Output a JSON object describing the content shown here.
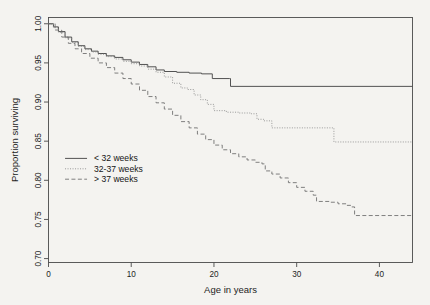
{
  "figure": {
    "kind": "kaplan-meier-survival-curve",
    "page_marker": "",
    "background_color": "#f4f3f0",
    "frame_color": "#4a4a4a"
  },
  "axes": {
    "x": {
      "label": "Age in years",
      "ticks": [
        0,
        10,
        20,
        30,
        40
      ],
      "tick_labels": [
        "0",
        "10",
        "20",
        "30",
        "40"
      ],
      "range": [
        0,
        44
      ]
    },
    "y": {
      "label": "Proportion surviving",
      "ticks": [
        0.7,
        0.75,
        0.8,
        0.85,
        0.9,
        0.95,
        1.0
      ],
      "tick_labels": [
        "0.70",
        "0.75",
        "0.80",
        "0.85",
        "0.90",
        "0.95",
        "1.00"
      ],
      "range": [
        0.695,
        1.008
      ]
    }
  },
  "legend": {
    "position": "left-middle",
    "items": [
      {
        "label": "< 32 weeks",
        "style": "solid",
        "color": "#4a4a4a"
      },
      {
        "label": "32-37 weeks",
        "style": "dotted",
        "color": "#8a8a8a"
      },
      {
        "label": "> 37 weeks",
        "style": "dashed",
        "color": "#6a6a6a"
      }
    ]
  },
  "chart_data": {
    "type": "line",
    "title": "",
    "subtitle": "",
    "xlabel": "Age in years",
    "ylabel": "Proportion surviving",
    "xlim": [
      0,
      44
    ],
    "ylim": [
      0.695,
      1.008
    ],
    "grid": false,
    "legend_position": "left-middle",
    "step_shape": "hv",
    "series": [
      {
        "name": "< 32 weeks",
        "style": "solid",
        "color": "#4a4a4a",
        "final_value": 0.92,
        "points": [
          [
            0,
            1.0
          ],
          [
            0.6,
            0.996
          ],
          [
            1.2,
            0.99
          ],
          [
            2.0,
            0.983
          ],
          [
            2.8,
            0.977
          ],
          [
            3.6,
            0.972
          ],
          [
            4.4,
            0.968
          ],
          [
            5.2,
            0.965
          ],
          [
            6.0,
            0.962
          ],
          [
            7.0,
            0.959
          ],
          [
            8.0,
            0.957
          ],
          [
            9.0,
            0.954
          ],
          [
            10.0,
            0.951
          ],
          [
            11.0,
            0.948
          ],
          [
            12.0,
            0.945
          ],
          [
            13.0,
            0.941
          ],
          [
            14.0,
            0.939
          ],
          [
            15.5,
            0.938
          ],
          [
            17.0,
            0.937
          ],
          [
            18.5,
            0.936
          ],
          [
            19.8,
            0.93
          ],
          [
            21.9,
            0.93
          ],
          [
            22.0,
            0.92
          ],
          [
            44.0,
            0.92
          ]
        ]
      },
      {
        "name": "32-37 weeks",
        "style": "dotted",
        "color": "#8a8a8a",
        "final_value": 0.849,
        "points": [
          [
            0,
            1.0
          ],
          [
            0.6,
            0.995
          ],
          [
            1.2,
            0.989
          ],
          [
            2.0,
            0.982
          ],
          [
            2.8,
            0.976
          ],
          [
            3.6,
            0.971
          ],
          [
            4.4,
            0.967
          ],
          [
            5.2,
            0.964
          ],
          [
            6.0,
            0.961
          ],
          [
            7.0,
            0.958
          ],
          [
            8.0,
            0.955
          ],
          [
            9.0,
            0.952
          ],
          [
            10.0,
            0.949
          ],
          [
            11.0,
            0.946
          ],
          [
            12.0,
            0.942
          ],
          [
            13.0,
            0.938
          ],
          [
            14.0,
            0.932
          ],
          [
            15.0,
            0.924
          ],
          [
            16.0,
            0.918
          ],
          [
            16.8,
            0.916
          ],
          [
            17.6,
            0.909
          ],
          [
            18.4,
            0.903
          ],
          [
            19.2,
            0.897
          ],
          [
            20.0,
            0.889
          ],
          [
            21.5,
            0.887
          ],
          [
            23.0,
            0.886
          ],
          [
            24.5,
            0.885
          ],
          [
            25.2,
            0.878
          ],
          [
            26.0,
            0.876
          ],
          [
            27.0,
            0.867
          ],
          [
            30.0,
            0.867
          ],
          [
            34.4,
            0.867
          ],
          [
            34.5,
            0.849
          ],
          [
            44.0,
            0.849
          ]
        ]
      },
      {
        "name": "> 37 weeks",
        "style": "dashed",
        "color": "#6a6a6a",
        "final_value": 0.755,
        "points": [
          [
            0,
            1.0
          ],
          [
            0.8,
            0.992
          ],
          [
            1.6,
            0.983
          ],
          [
            2.4,
            0.975
          ],
          [
            3.2,
            0.968
          ],
          [
            4.0,
            0.962
          ],
          [
            5.0,
            0.956
          ],
          [
            6.0,
            0.95
          ],
          [
            7.0,
            0.944
          ],
          [
            8.0,
            0.937
          ],
          [
            9.0,
            0.93
          ],
          [
            10.0,
            0.923
          ],
          [
            11.0,
            0.915
          ],
          [
            12.0,
            0.907
          ],
          [
            13.0,
            0.899
          ],
          [
            14.0,
            0.891
          ],
          [
            15.0,
            0.883
          ],
          [
            16.0,
            0.875
          ],
          [
            17.0,
            0.867
          ],
          [
            18.0,
            0.859
          ],
          [
            19.0,
            0.852
          ],
          [
            20.0,
            0.845
          ],
          [
            21.0,
            0.839
          ],
          [
            22.0,
            0.834
          ],
          [
            23.0,
            0.83
          ],
          [
            24.0,
            0.826
          ],
          [
            25.0,
            0.823
          ],
          [
            25.8,
            0.821
          ],
          [
            26.2,
            0.812
          ],
          [
            27.0,
            0.808
          ],
          [
            28.0,
            0.803
          ],
          [
            29.0,
            0.797
          ],
          [
            30.0,
            0.791
          ],
          [
            31.0,
            0.786
          ],
          [
            32.0,
            0.781
          ],
          [
            32.4,
            0.773
          ],
          [
            34.0,
            0.772
          ],
          [
            35.0,
            0.77
          ],
          [
            36.0,
            0.768
          ],
          [
            36.6,
            0.766
          ],
          [
            37.0,
            0.755
          ],
          [
            44.0,
            0.755
          ]
        ]
      }
    ]
  }
}
